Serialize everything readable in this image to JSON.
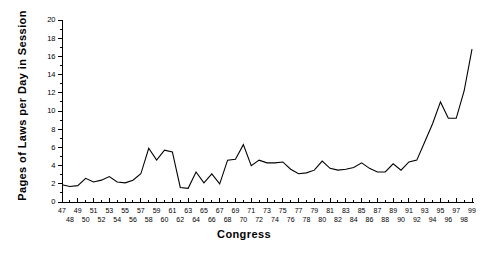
{
  "chart_data": {
    "type": "line",
    "title": "",
    "xlabel": "Congress",
    "ylabel": "Pages of Laws per Day in Session",
    "xlim": [
      47,
      99
    ],
    "ylim": [
      0,
      20
    ],
    "grid": false,
    "legend": false,
    "line_color": "#000000",
    "background_color": "#ffffff",
    "ytick_labels": [
      "0",
      "2",
      "4",
      "6",
      "8",
      "10",
      "12",
      "14",
      "16",
      "18",
      "20"
    ],
    "ytick_values": [
      0,
      2,
      4,
      6,
      8,
      10,
      12,
      14,
      16,
      18,
      20
    ],
    "xtick_labels_upper": [
      "47",
      "49",
      "51",
      "53",
      "55",
      "57",
      "59",
      "61",
      "63",
      "65",
      "67",
      "69",
      "71",
      "73",
      "75",
      "77",
      "79",
      "81",
      "83",
      "85",
      "87",
      "89",
      "91",
      "93",
      "95",
      "97",
      "99"
    ],
    "xtick_labels_lower": [
      "48",
      "50",
      "52",
      "54",
      "56",
      "58",
      "60",
      "62",
      "64",
      "66",
      "68",
      "70",
      "72",
      "74",
      "76",
      "78",
      "80",
      "82",
      "84",
      "86",
      "88",
      "90",
      "92",
      "94",
      "96",
      "98"
    ],
    "x": [
      47,
      48,
      49,
      50,
      51,
      52,
      53,
      54,
      55,
      56,
      57,
      58,
      59,
      60,
      61,
      62,
      63,
      64,
      65,
      66,
      67,
      68,
      69,
      70,
      71,
      72,
      73,
      74,
      75,
      76,
      77,
      78,
      79,
      80,
      81,
      82,
      83,
      84,
      85,
      86,
      87,
      88,
      89,
      90,
      91,
      92,
      93,
      94,
      95,
      96,
      97,
      98,
      99
    ],
    "values": [
      1.9,
      1.7,
      1.8,
      2.6,
      2.2,
      2.4,
      2.8,
      2.2,
      2.1,
      2.4,
      3.1,
      5.9,
      4.6,
      5.7,
      5.5,
      1.6,
      1.5,
      3.3,
      2.1,
      3.1,
      2.0,
      4.6,
      4.7,
      6.3,
      4.0,
      4.6,
      4.3,
      4.3,
      4.4,
      3.6,
      3.1,
      3.2,
      3.5,
      4.5,
      3.7,
      3.5,
      3.6,
      3.8,
      4.3,
      3.7,
      3.3,
      3.3,
      4.2,
      3.5,
      4.4,
      4.6,
      6.6,
      8.6,
      11.0,
      9.2,
      9.2,
      12.2,
      16.8
    ]
  }
}
